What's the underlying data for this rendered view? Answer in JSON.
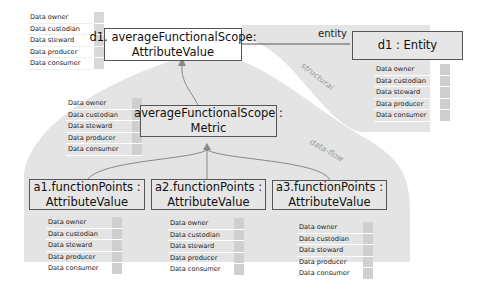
{
  "diagram": {
    "nodes": {
      "d1_attr": {
        "line1": "d1. averageFunctionalScope:",
        "line2": "AttributeValue"
      },
      "d1_entity": {
        "line1": "d1 : Entity"
      },
      "metric": {
        "line1": "averageFunctionalScope :",
        "line2": "Metric"
      },
      "a1": {
        "line1": "a1.functionPoints :",
        "line2": "AttributeValue"
      },
      "a2": {
        "line1": "a2.functionPoints :",
        "line2": "AttributeValue"
      },
      "a3": {
        "line1": "a3.functionPoints :",
        "line2": "AttributeValue"
      }
    },
    "roles": [
      "Data owner",
      "Data custodian",
      "Data steward",
      "Data producer",
      "Data consumer"
    ],
    "edge_labels": {
      "entity": "entity"
    },
    "region_labels": {
      "structural": "structural",
      "data_flow": "data-flow"
    },
    "colors": {
      "region_fill": "#e4e4e4",
      "box_border": "#555555",
      "swatch": "#cfcfcf",
      "edge": "#888888"
    }
  }
}
